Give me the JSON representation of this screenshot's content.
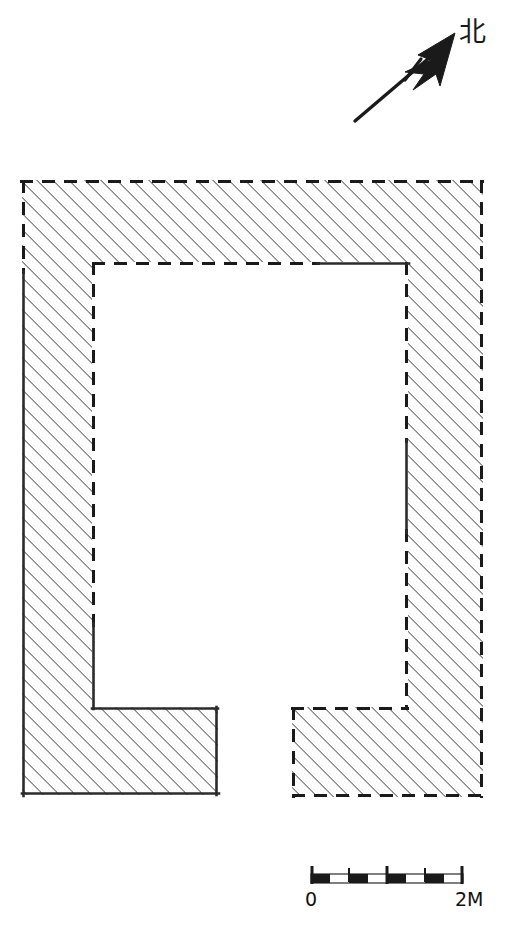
{
  "figure": {
    "kind": "architectural-site-plan",
    "background_color": "#ffffff",
    "ink_color": "#1a1a1a",
    "hatch_color": "#4a4a4a"
  },
  "compass": {
    "label": "北",
    "icon": "north-arrow-icon",
    "bearing_note": "arrow points up and to the right",
    "tail": {
      "x": 355,
      "y": 121
    },
    "head": {
      "x": 455,
      "y": 36
    },
    "cross_tick": {
      "x": 412,
      "y": 68
    }
  },
  "scale_bar": {
    "icon": "scale-bar-icon",
    "start_label": "0",
    "end_label": "2M",
    "unit": "M",
    "total_length_units": 2,
    "bar": {
      "x": 311,
      "y": 874,
      "width": 152,
      "height": 9
    },
    "segments": [
      {
        "filled": true,
        "from": 0.0,
        "to": 0.125
      },
      {
        "filled": false,
        "from": 0.125,
        "to": 0.25
      },
      {
        "filled": true,
        "from": 0.25,
        "to": 0.375
      },
      {
        "filled": false,
        "from": 0.375,
        "to": 0.5
      },
      {
        "filled": true,
        "from": 0.5,
        "to": 0.625
      },
      {
        "filled": false,
        "from": 0.625,
        "to": 0.75
      },
      {
        "filled": true,
        "from": 0.75,
        "to": 0.875
      },
      {
        "filled": false,
        "from": 0.875,
        "to": 1.0
      }
    ],
    "ticks": [
      0.0,
      0.25,
      0.5,
      0.75,
      1.0
    ]
  },
  "plan": {
    "outer_bounds": {
      "left": 22,
      "right": 483,
      "top": 180,
      "bottom": 797
    },
    "courtyard": {
      "left": 92,
      "right": 408,
      "top": 262,
      "bottom": 707
    },
    "wall_thickness_left": 70,
    "wall_thickness_right": 75,
    "wall_thickness_top": 82,
    "bottom_opening": {
      "from_x": 218,
      "to_x": 292,
      "y": 707
    },
    "left_foot": {
      "left": 22,
      "right": 218,
      "top": 707,
      "bottom": 795
    },
    "right_foot": {
      "left": 292,
      "right": 483,
      "top": 707,
      "bottom": 797
    },
    "edge_legend": [
      {
        "style": "dashed",
        "meaning": "reconstructed / inferred wall line"
      },
      {
        "style": "solid",
        "meaning": "surviving excavated wall face"
      }
    ],
    "solid_edges": [
      {
        "name": "outer-left-wall-face",
        "from": [
          22,
          272
        ],
        "to": [
          22,
          795
        ]
      },
      {
        "name": "left-foot-bottom-edge",
        "from": [
          22,
          795
        ],
        "to": [
          218,
          795
        ]
      },
      {
        "name": "left-foot-right-edge",
        "from": [
          218,
          795
        ],
        "to": [
          218,
          707
        ]
      },
      {
        "name": "courtyard-bottom-left-edge",
        "from": [
          218,
          707
        ],
        "to": [
          92,
          707
        ]
      },
      {
        "name": "courtyard-inner-left-lower",
        "from": [
          92,
          707
        ],
        "to": [
          92,
          625
        ]
      },
      {
        "name": "courtyard-inner-top-right",
        "from": [
          318,
          262
        ],
        "to": [
          408,
          262
        ]
      },
      {
        "name": "courtyard-inner-right-mid",
        "from": [
          408,
          440
        ],
        "to": [
          408,
          532
        ]
      }
    ]
  }
}
